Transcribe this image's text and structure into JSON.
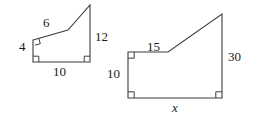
{
  "figure": {
    "type": "similar-polygons-geometry-diagram",
    "stroke_color": "#3d3d3d",
    "text_color": "#1a1a1a",
    "background": "#ffffff",
    "shapes": [
      {
        "name": "left-polygon",
        "description": "Right-trapezoid-like pentagon with two right angle marks",
        "vertices": [
          [
            33,
            40
          ],
          [
            68,
            30
          ],
          [
            90,
            5
          ],
          [
            90,
            62
          ],
          [
            33,
            62
          ]
        ],
        "right_angle_marks": [
          {
            "at": [
              33,
              40
            ],
            "corner": "top-left"
          },
          {
            "at": [
              33,
              62
            ],
            "corner": "bottom-left"
          },
          {
            "at": [
              90,
              62
            ],
            "corner": "bottom-right"
          }
        ],
        "labels": {
          "left_side": "4",
          "top_side": "6",
          "bottom_side": "10",
          "right_side": "12"
        }
      },
      {
        "name": "right-polygon",
        "description": "Scaled copy of left polygon with unknown base x",
        "vertices": [
          [
            128,
            52
          ],
          [
            168,
            52
          ],
          [
            222,
            14
          ],
          [
            222,
            98
          ],
          [
            128,
            98
          ]
        ],
        "right_angle_marks": [
          {
            "at": [
              128,
              52
            ],
            "corner": "top-left"
          },
          {
            "at": [
              128,
              98
            ],
            "corner": "bottom-left"
          },
          {
            "at": [
              222,
              98
            ],
            "corner": "bottom-right"
          }
        ],
        "labels": {
          "top_side": "15",
          "left_side": "10",
          "right_side": "30",
          "bottom_side": "x"
        }
      }
    ]
  },
  "labels": {
    "left": {
      "side_4": "4",
      "side_6": "6",
      "side_10": "10",
      "side_12": "12"
    },
    "right": {
      "side_15": "15",
      "side_10": "10",
      "side_30": "30",
      "side_x": "x"
    }
  }
}
